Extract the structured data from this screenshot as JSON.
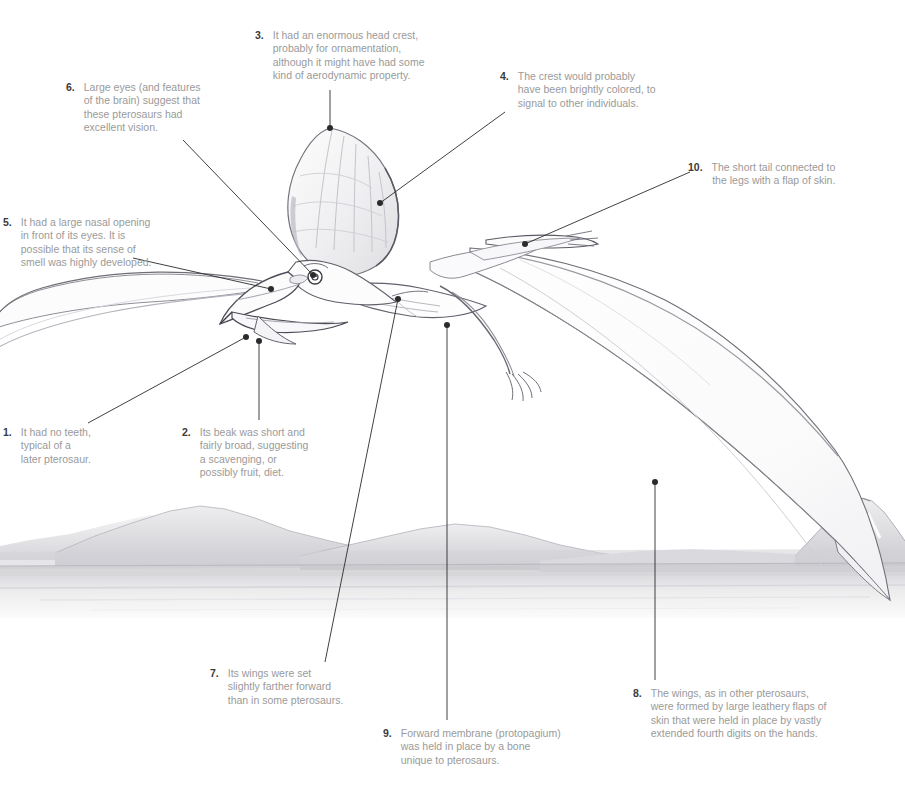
{
  "figure": {
    "medium": "pencil-illustration",
    "background_color": "#ffffff",
    "number_color": "#3a3a3a",
    "text_color": "#9a9a9a",
    "leader_color": "#2b2b2b",
    "scene": {
      "sky": "#ffffff",
      "mountains": "#d8d8da",
      "water": "#e9e9ea",
      "volcano": "far-right-snow-capped-peak"
    },
    "animal": {
      "parts": [
        "head-crest",
        "beak",
        "eye",
        "neck",
        "body",
        "left-wing",
        "right-wing",
        "legs",
        "feet",
        "tail",
        "wing-membrane"
      ],
      "outline_color": "#5a5a60",
      "shade_color": "#cfcfd4"
    }
  },
  "callouts": [
    {
      "id": 1,
      "number": "1.",
      "align": "left",
      "lines": [
        "It had no teeth,",
        "typical of a",
        "later pterosaur."
      ],
      "label_x": 3,
      "label_y": 426,
      "label_w": 150,
      "anchor_x": 246,
      "anchor_y": 337,
      "bend_x": 88,
      "bend_y": 423
    },
    {
      "id": 2,
      "number": "2.",
      "align": "left",
      "lines": [
        "Its beak was short and",
        "fairly broad, suggesting",
        "a scavenging, or",
        "possibly fruit, diet."
      ],
      "label_x": 182,
      "label_y": 426,
      "label_w": 150,
      "anchor_x": 259,
      "anchor_y": 341,
      "bend_x": 259,
      "bend_y": 420
    },
    {
      "id": 3,
      "number": "3.",
      "align": "left",
      "lines": [
        "It had an enormous head crest,",
        "probably for ornamentation,",
        "although it might have had some",
        "kind of aerodynamic property."
      ],
      "label_x": 255,
      "label_y": 29,
      "label_w": 215,
      "anchor_x": 330,
      "anchor_y": 128,
      "bend_x": 330,
      "bend_y": 90
    },
    {
      "id": 4,
      "number": "4.",
      "align": "left",
      "lines": [
        "The crest would probably",
        "have been brightly colored, to",
        "signal to other individuals."
      ],
      "label_x": 500,
      "label_y": 70,
      "label_w": 180,
      "anchor_x": 380,
      "anchor_y": 203,
      "bend_x": 505,
      "bend_y": 112
    },
    {
      "id": 5,
      "number": "5.",
      "align": "left",
      "lines": [
        "It had a large nasal opening",
        "in front of its eyes. It is",
        "possible that its sense of",
        "smell was highly developed."
      ],
      "label_x": 3,
      "label_y": 216,
      "label_w": 152,
      "anchor_x": 271,
      "anchor_y": 289,
      "bend_x": 133,
      "bend_y": 258
    },
    {
      "id": 6,
      "number": "6.",
      "align": "left",
      "lines": [
        "Large eyes (and features",
        "of the brain) suggest that",
        "these pterosaurs had",
        "excellent vision."
      ],
      "label_x": 66,
      "label_y": 81,
      "label_w": 160,
      "anchor_x": 313,
      "anchor_y": 275,
      "bend_x": 183,
      "bend_y": 140
    },
    {
      "id": 7,
      "number": "7.",
      "align": "left",
      "lines": [
        "Its wings were set",
        "slightly farther forward",
        "than in some pterosaurs."
      ],
      "label_x": 210,
      "label_y": 667,
      "label_w": 150,
      "anchor_x": 398,
      "anchor_y": 299,
      "bend_x": 325,
      "bend_y": 662
    },
    {
      "id": 8,
      "number": "8.",
      "align": "left",
      "lines": [
        "The wings, as in other pterosaurs,",
        "were formed by large leathery flaps of",
        "skin that were held in place by vastly",
        "extended fourth digits on the hands."
      ],
      "label_x": 633,
      "label_y": 687,
      "label_w": 240,
      "anchor_x": 655,
      "anchor_y": 482,
      "bend_x": 655,
      "bend_y": 680
    },
    {
      "id": 9,
      "number": "9.",
      "align": "left",
      "lines": [
        "Forward membrane (protopagium)",
        "was held in place by a bone",
        "unique to pterosaurs."
      ],
      "label_x": 383,
      "label_y": 727,
      "label_w": 210,
      "anchor_x": 447,
      "anchor_y": 325,
      "bend_x": 447,
      "bend_y": 720
    },
    {
      "id": 10,
      "number": "10.",
      "align": "right",
      "lines": [
        "The short tail connected to",
        "the legs with a flap of skin."
      ],
      "label_x": 688,
      "label_y": 161,
      "label_w": 212,
      "anchor_x": 525,
      "anchor_y": 244,
      "bend_x": 690,
      "bend_y": 172
    }
  ]
}
